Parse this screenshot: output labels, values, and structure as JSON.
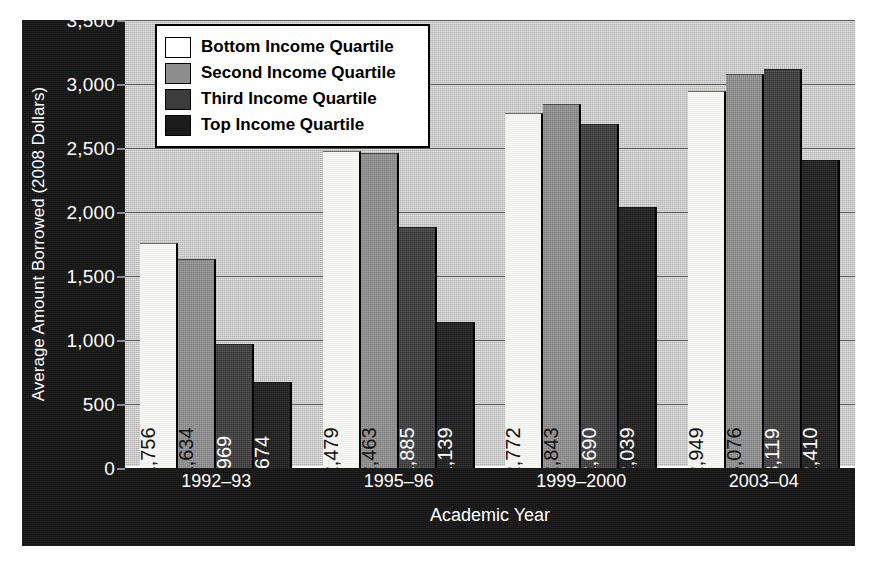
{
  "chart_data": {
    "type": "bar",
    "title": "",
    "xlabel": "Academic Year",
    "ylabel": "Average Amount Borrowed (2008 Dollars)",
    "categories": [
      "1992–93",
      "1995–96",
      "1999–2000",
      "2003–04"
    ],
    "ylim": [
      0,
      3500
    ],
    "yticks": [
      "0",
      "500",
      "1,000",
      "1,500",
      "2,000",
      "2,500",
      "3,000",
      "3,500"
    ],
    "ytick_values": [
      0,
      500,
      1000,
      1500,
      2000,
      2500,
      3000,
      3500
    ],
    "grid": true,
    "legend_position": "top-left",
    "series": [
      {
        "name": "Bottom Income Quartile",
        "color": "#ffffff",
        "label_color": "#121212",
        "values": [
          1756,
          2479,
          2772,
          2949
        ],
        "labels": [
          "$1,756",
          "$2,479",
          "$2,772",
          "$2,949"
        ]
      },
      {
        "name": "Second Income Quartile",
        "color": "#8d8d8d",
        "label_color": "#121212",
        "values": [
          1634,
          2463,
          2843,
          3076
        ],
        "labels": [
          "$1,634",
          "$2,463",
          "$2,843",
          "$3,076"
        ]
      },
      {
        "name": "Third Income Quartile",
        "color": "#3c3c3c",
        "label_color": "#ffffff",
        "values": [
          969,
          1885,
          2690,
          3119
        ],
        "labels": [
          "$969",
          "$1,885",
          "$2,690",
          "$3,119"
        ]
      },
      {
        "name": "Top Income Quartile",
        "color": "#1b1b1b",
        "label_color": "#ffffff",
        "values": [
          674,
          1139,
          2039,
          2410
        ],
        "labels": [
          "$674",
          "$1,139",
          "$2,039",
          "$2,410"
        ]
      }
    ]
  },
  "colors": {
    "panel_background": "#141414",
    "plot_background": "#c4c4c4",
    "gridline": "#5a5a5a",
    "axis_text": "#ffffff"
  }
}
